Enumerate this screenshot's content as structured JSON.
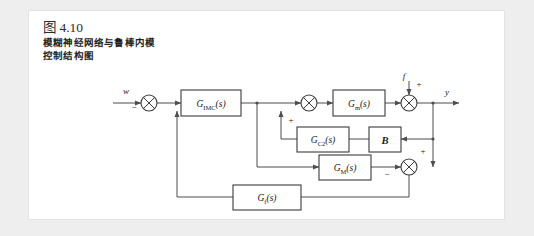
{
  "figure": {
    "number": "图 4.10",
    "caption_line1": "模糊神经网络与鲁棒内模",
    "caption_line2": "控制结构图"
  },
  "diagram": {
    "type": "block-diagram",
    "blocks": [
      {
        "id": "gimc",
        "label_main": "G",
        "label_sub": "IMC",
        "label_tail": "(s)"
      },
      {
        "id": "gm_plant",
        "label_main": "G",
        "label_sub": "m",
        "label_tail": "(s)"
      },
      {
        "id": "gc2",
        "label_main": "G",
        "label_sub": "C2",
        "label_tail": "(s)"
      },
      {
        "id": "b_matrix",
        "label_main": "B"
      },
      {
        "id": "gm_model",
        "label_main": "G",
        "label_sub": "M",
        "label_tail": "(s)"
      },
      {
        "id": "gf",
        "label_main": "G",
        "label_sub": "f",
        "label_tail": "(s)"
      }
    ],
    "signals": {
      "reference": "w",
      "disturbance": "f",
      "output": "y"
    },
    "signs": {
      "sum1_feedback": "−",
      "sum2_lower": "+",
      "sum3_disturbance": "+",
      "sum4_top": "+",
      "sum4_left": "−"
    },
    "colors": {
      "page_background": "#eeeeee",
      "card_background": "#ffffff",
      "wire": "#4d4d4d",
      "block_stroke": "#3b3b3b",
      "text": "#1a1a1a"
    }
  }
}
